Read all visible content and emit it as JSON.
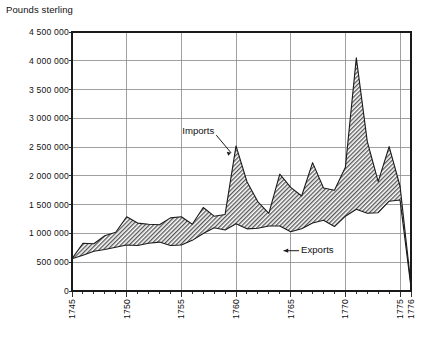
{
  "chart_data": {
    "type": "area",
    "title": "",
    "ylabel": "Pounds sterling",
    "xlabel": "",
    "ylim": [
      0,
      4500000
    ],
    "xlim": [
      1745,
      1776
    ],
    "grid": true,
    "legend_position": "inline-annotations",
    "ytick_labels": [
      "4 500 000",
      "4 000 000",
      "3 500 000",
      "3 000 000",
      "2 500 000",
      "2 000 000",
      "1 500 000",
      "1 000 000",
      "500 000",
      "0"
    ],
    "ytick_values": [
      4500000,
      4000000,
      3500000,
      3000000,
      2500000,
      2000000,
      1500000,
      1000000,
      500000,
      0
    ],
    "xtick_labels": [
      "1745",
      "1750",
      "1755",
      "1760",
      "1765",
      "1770",
      "1775",
      "1776"
    ],
    "xtick_values": [
      1745,
      1750,
      1755,
      1760,
      1765,
      1770,
      1775,
      1776
    ],
    "xtick_minor_step": 1,
    "annotations": [
      {
        "text": "Imports",
        "x": 1758.1,
        "y": 2760000
      },
      {
        "text": "Exports",
        "x": 1765.4,
        "y": 700000
      }
    ],
    "x": [
      1745,
      1746,
      1747,
      1748,
      1749,
      1750,
      1751,
      1752,
      1753,
      1754,
      1755,
      1756,
      1757,
      1758,
      1759,
      1760,
      1761,
      1762,
      1763,
      1764,
      1765,
      1766,
      1767,
      1768,
      1769,
      1770,
      1771,
      1772,
      1773,
      1774,
      1775,
      1776
    ],
    "series": [
      {
        "name": "Imports",
        "values": [
          560000,
          830000,
          820000,
          960000,
          1020000,
          1290000,
          1180000,
          1160000,
          1150000,
          1270000,
          1290000,
          1160000,
          1450000,
          1300000,
          1330000,
          2520000,
          1900000,
          1550000,
          1350000,
          2030000,
          1800000,
          1650000,
          2230000,
          1790000,
          1750000,
          2150000,
          4050000,
          2600000,
          1900000,
          2510000,
          1820000,
          100000
        ]
      },
      {
        "name": "Exports",
        "values": [
          560000,
          620000,
          690000,
          720000,
          760000,
          800000,
          790000,
          830000,
          850000,
          790000,
          800000,
          880000,
          1000000,
          1100000,
          1060000,
          1170000,
          1080000,
          1090000,
          1130000,
          1130000,
          1030000,
          1080000,
          1180000,
          1230000,
          1120000,
          1300000,
          1420000,
          1350000,
          1360000,
          1560000,
          1580000,
          60000
        ]
      }
    ],
    "colors": {
      "axis": "#1a1a1a",
      "grid": "#8a8a8a",
      "line": "#1a1a1a",
      "fill_hatch": "#4d4d4d",
      "background": "#ffffff",
      "text": "#111111"
    }
  },
  "plot_area": {
    "left": 72,
    "top": 32,
    "right": 411,
    "bottom": 291
  }
}
